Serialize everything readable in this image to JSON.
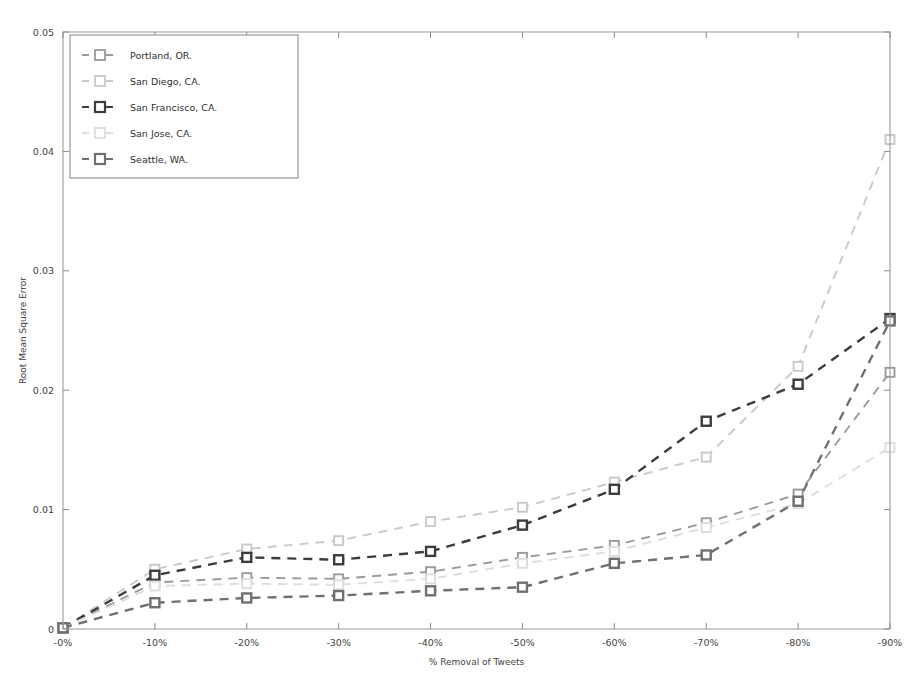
{
  "chart_data": {
    "type": "line",
    "title": "",
    "xlabel": "% Removal of Tweets",
    "ylabel": "Root Mean Square Error",
    "categories": [
      "-0%",
      "-10%",
      "-20%",
      "-30%",
      "-40%",
      "-50%",
      "-60%",
      "-70%",
      "-80%",
      "-90%"
    ],
    "x_tick_labels": [
      "-0%",
      "-10%",
      "-20%",
      "-30%",
      "-40%",
      "-50%",
      "-60%",
      "-70%",
      "-80%",
      "-90%"
    ],
    "y_tick_labels": [
      "0",
      "0.01",
      "0.02",
      "0.03",
      "0.04",
      "0.05"
    ],
    "y_tick_values": [
      0,
      0.01,
      0.02,
      0.03,
      0.04,
      0.05
    ],
    "ylim": [
      0,
      0.05
    ],
    "xlim": [
      0,
      9
    ],
    "grid": false,
    "legend_position": "upper left",
    "line_style": "dashed",
    "marker_style": "square-open",
    "series": [
      {
        "name": "Portland, OR.",
        "color": "#9a9a9a",
        "values": [
          0.0001,
          0.0039,
          0.0043,
          0.0042,
          0.0048,
          0.006,
          0.007,
          0.0089,
          0.0113,
          0.0215
        ]
      },
      {
        "name": "San Diego, CA.",
        "color": "#c9c9c9",
        "values": [
          0.0001,
          0.005,
          0.0067,
          0.0074,
          0.009,
          0.0102,
          0.0123,
          0.0144,
          0.022,
          0.041
        ]
      },
      {
        "name": "San Francisco, CA.",
        "color": "#3c3c3c",
        "values": [
          0.0001,
          0.0045,
          0.006,
          0.0058,
          0.0065,
          0.0087,
          0.0117,
          0.0174,
          0.0205,
          0.026
        ]
      },
      {
        "name": "San Jose, CA.",
        "color": "#dddddd",
        "values": [
          0.0001,
          0.0036,
          0.0038,
          0.0037,
          0.0042,
          0.0055,
          0.0065,
          0.0085,
          0.0105,
          0.0152
        ]
      },
      {
        "name": "Seattle, WA.",
        "color": "#6f6f6f",
        "values": [
          0.0001,
          0.0022,
          0.0026,
          0.0028,
          0.0032,
          0.0035,
          0.0055,
          0.0062,
          0.0107,
          0.0258
        ]
      }
    ]
  }
}
